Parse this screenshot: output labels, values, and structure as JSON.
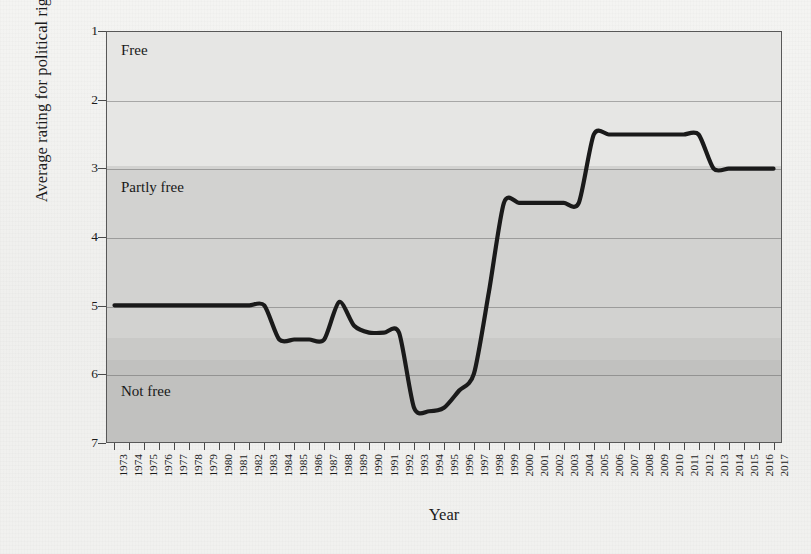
{
  "axes": {
    "ylabel": "Average rating for political rights and civil liberties",
    "xlabel": "Year",
    "yticks": [
      "1",
      "2",
      "3",
      "4",
      "5",
      "6",
      "7"
    ]
  },
  "bands": [
    {
      "label": "Free",
      "from": 1.0,
      "to": 2.95,
      "color": "#e4e4e2"
    },
    {
      "label": "Partly free",
      "from": 2.95,
      "to": 5.45,
      "color": "#d0d0ce"
    },
    {
      "label": "Not free",
      "from": 5.45,
      "to": 7.0,
      "color": "#c3c3c1"
    }
  ],
  "band_shades": [
    {
      "from": 1.0,
      "to": 2.95,
      "color": "#e6e6e4"
    },
    {
      "from": 2.95,
      "to": 5.45,
      "color": "#d2d2d0"
    },
    {
      "from": 5.45,
      "to": 5.78,
      "color": "#c9c9c7"
    },
    {
      "from": 5.78,
      "to": 7.0,
      "color": "#c1c1bf"
    }
  ],
  "line": {
    "color": "#1a1a1a",
    "width": 4.2
  },
  "chart_data": {
    "type": "line",
    "title": "",
    "xlabel": "Year",
    "ylabel": "Average rating for political rights and civil liberties",
    "xlim": [
      1973,
      2017
    ],
    "ylim": [
      7,
      1
    ],
    "y_inverted": true,
    "grid": true,
    "legend": null,
    "yticks": [
      1,
      2,
      3,
      4,
      5,
      6,
      7
    ],
    "annotations": [
      {
        "text": "Free",
        "y_range": [
          1,
          3
        ]
      },
      {
        "text": "Partly free",
        "y_range": [
          3,
          5.5
        ]
      },
      {
        "text": "Not free",
        "y_range": [
          5.5,
          7
        ]
      }
    ],
    "x": [
      1973,
      1974,
      1975,
      1976,
      1977,
      1978,
      1979,
      1980,
      1981,
      1982,
      1983,
      1984,
      1985,
      1986,
      1987,
      1988,
      1989,
      1990,
      1991,
      1992,
      1993,
      1994,
      1995,
      1996,
      1997,
      1998,
      1999,
      2000,
      2001,
      2002,
      2003,
      2004,
      2005,
      2006,
      2007,
      2008,
      2009,
      2010,
      2011,
      2012,
      2013,
      2014,
      2015,
      2016,
      2017
    ],
    "values": [
      5.0,
      5.0,
      5.0,
      5.0,
      5.0,
      5.0,
      5.0,
      5.0,
      5.0,
      5.0,
      5.0,
      5.5,
      5.5,
      5.5,
      5.5,
      4.95,
      5.3,
      5.4,
      5.4,
      5.4,
      6.5,
      6.55,
      6.5,
      6.25,
      6.0,
      4.8,
      3.5,
      3.5,
      3.5,
      3.5,
      3.5,
      3.5,
      2.5,
      2.5,
      2.5,
      2.5,
      2.5,
      2.5,
      2.5,
      2.5,
      3.0,
      3.0,
      3.0,
      3.0,
      3.0
    ],
    "series": [
      {
        "name": "Average rating for political rights and civil liberties",
        "values": [
          5.0,
          5.0,
          5.0,
          5.0,
          5.0,
          5.0,
          5.0,
          5.0,
          5.0,
          5.0,
          5.0,
          5.5,
          5.5,
          5.5,
          5.5,
          4.95,
          5.3,
          5.4,
          5.4,
          5.4,
          6.5,
          6.55,
          6.5,
          6.25,
          6.0,
          4.8,
          3.5,
          3.5,
          3.5,
          3.5,
          3.5,
          3.5,
          2.5,
          2.5,
          2.5,
          2.5,
          2.5,
          2.5,
          2.5,
          2.5,
          3.0,
          3.0,
          3.0,
          3.0,
          3.0
        ]
      }
    ]
  }
}
